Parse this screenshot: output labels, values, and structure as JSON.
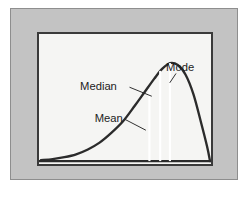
{
  "figure": {
    "name": "skewed-distribution-diagram",
    "panel_color": "#c3c3c3",
    "panel_border_color": "#8e8e8e",
    "plot_background": "#f5f5f3",
    "plot_border_color": "#3a3a3a",
    "curve_color": "#2b2b2b",
    "marker_color": "#ffffff",
    "label_color": "#1c1c1c",
    "caption_fragment": "  "
  },
  "chart_data": {
    "type": "line",
    "title": "",
    "subtitle": "",
    "xlabel": "",
    "ylabel": "",
    "xlim": [
      0,
      176
    ],
    "ylim": [
      0,
      134
    ],
    "grid": false,
    "legend": "none",
    "distribution": "positively skewed (right-skewed) unimodal density curve",
    "annotations": [
      {
        "label": "Mean",
        "marker_x": 113,
        "curve_y": 54,
        "label_x": 57,
        "label_y": 91,
        "leader_from_x": 88,
        "leader_from_y": 88,
        "leader_to_x": 109,
        "leader_to_y": 99
      },
      {
        "label": "Median",
        "marker_x": 124,
        "curve_y": 35,
        "label_x": 42,
        "label_y": 58,
        "leader_from_x": 93,
        "leader_from_y": 55,
        "leader_to_x": 115,
        "leader_to_y": 64
      },
      {
        "label": "Mode",
        "marker_x": 134,
        "curve_y": 25,
        "label_x": 130,
        "label_y": 38,
        "leader_from_x": 140,
        "leader_from_y": 41,
        "leader_to_x": 134,
        "leader_to_y": 50
      }
    ],
    "curve_points": [
      [
        2,
        130
      ],
      [
        14,
        129
      ],
      [
        26,
        127
      ],
      [
        38,
        124
      ],
      [
        50,
        119
      ],
      [
        62,
        112
      ],
      [
        74,
        102
      ],
      [
        86,
        90
      ],
      [
        98,
        74
      ],
      [
        108,
        60
      ],
      [
        118,
        46
      ],
      [
        126,
        36
      ],
      [
        134,
        30
      ],
      [
        142,
        32
      ],
      [
        150,
        42
      ],
      [
        158,
        62
      ],
      [
        166,
        92
      ],
      [
        172,
        116
      ],
      [
        175,
        131
      ]
    ],
    "baseline_y": 131,
    "marker_lines": [
      {
        "name": "Mean",
        "x": 113,
        "y_top": 57,
        "y_bottom": 131
      },
      {
        "name": "Median",
        "x": 124,
        "y_top": 38,
        "y_bottom": 131
      },
      {
        "name": "Mode",
        "x": 134,
        "y_top": 30,
        "y_bottom": 131
      }
    ]
  }
}
